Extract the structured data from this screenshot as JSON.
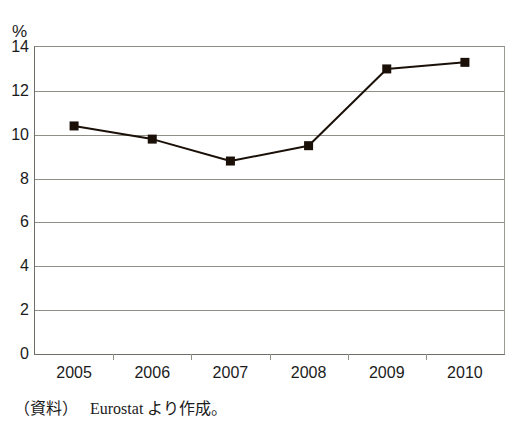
{
  "chart_data": {
    "type": "line",
    "title": "",
    "subtitle": "",
    "xlabel": "",
    "ylabel": "%",
    "unit_label": "%",
    "categories": [
      "2005",
      "2006",
      "2007",
      "2008",
      "2009",
      "2010"
    ],
    "x": [
      2005,
      2006,
      2007,
      2008,
      2009,
      2010
    ],
    "values": [
      10.4,
      9.8,
      8.8,
      9.5,
      13.0,
      13.3
    ],
    "series": [
      {
        "name": "",
        "values": [
          10.4,
          9.8,
          8.8,
          9.5,
          13.0,
          13.3
        ],
        "color": "#1a1008",
        "marker": "square",
        "line_width": 2
      }
    ],
    "ylim": [
      0,
      14
    ],
    "yticks": [
      0,
      2,
      4,
      6,
      8,
      10,
      12,
      14
    ],
    "ytick_labels": [
      "0",
      "2",
      "4",
      "6",
      "8",
      "10",
      "12",
      "14"
    ],
    "grid": true,
    "grid_axis": "y",
    "legend": false,
    "legend_position": "none",
    "annotations": []
  },
  "source_note": {
    "label": "（資料）",
    "text": "Eurostat より作成。"
  },
  "colors": {
    "line": "#1a1008",
    "marker": "#1a1008",
    "grid": "#8f8f86",
    "axis": "#6e6e66",
    "text": "#1b1b1b",
    "background": "#ffffff"
  }
}
